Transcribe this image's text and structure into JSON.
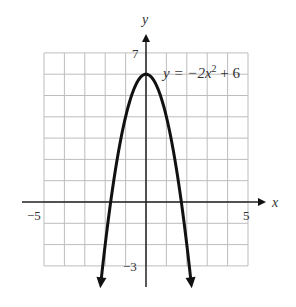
{
  "chart_data": {
    "type": "line",
    "title": "",
    "equation_label": "y = −2x² + 6",
    "function": "y = -2x^2 + 6",
    "xlabel": "x",
    "ylabel": "y",
    "xlim": [
      -5,
      5
    ],
    "ylim": [
      -3,
      7
    ],
    "grid": true,
    "x_tick_labels": [
      {
        "value": -5,
        "label": "−5"
      },
      {
        "value": 5,
        "label": "5"
      }
    ],
    "y_tick_labels": [
      {
        "value": 7,
        "label": "7"
      },
      {
        "value": -3,
        "label": "−3"
      }
    ],
    "series": [
      {
        "name": "y = -2x^2 + 6",
        "x": [
          -2.24,
          -2,
          -1.5,
          -1,
          -0.5,
          0,
          0.5,
          1,
          1.5,
          2,
          2.24
        ],
        "y": [
          -4.04,
          -2,
          1.5,
          4,
          5.5,
          6,
          5.5,
          4,
          1.5,
          -2,
          -4.04
        ],
        "arrows_at_ends": true
      }
    ],
    "key_points": {
      "vertex": [
        0,
        6
      ],
      "x_intercepts": [
        -1.73,
        1.73
      ]
    }
  },
  "labels": {
    "x_axis": "x",
    "y_axis": "y",
    "x_min": "−5",
    "x_max": "5",
    "y_max": "7",
    "y_min": "−3",
    "equation_prefix": "y = −2x",
    "equation_exp": "2",
    "equation_suffix": " + 6"
  }
}
